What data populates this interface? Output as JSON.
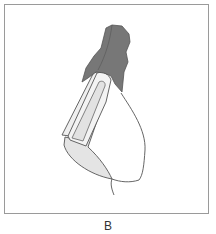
{
  "figure": {
    "caption": "B",
    "colors": {
      "gingiva": "#7a7a7a",
      "veneer_shell": "#e6e6e6",
      "inner_core": "#ececec",
      "outline": "#555555",
      "frame": "#9a9a9a"
    },
    "parts": [
      "gingiva",
      "veneer",
      "tooth-core",
      "crown-outline",
      "root-line"
    ]
  }
}
